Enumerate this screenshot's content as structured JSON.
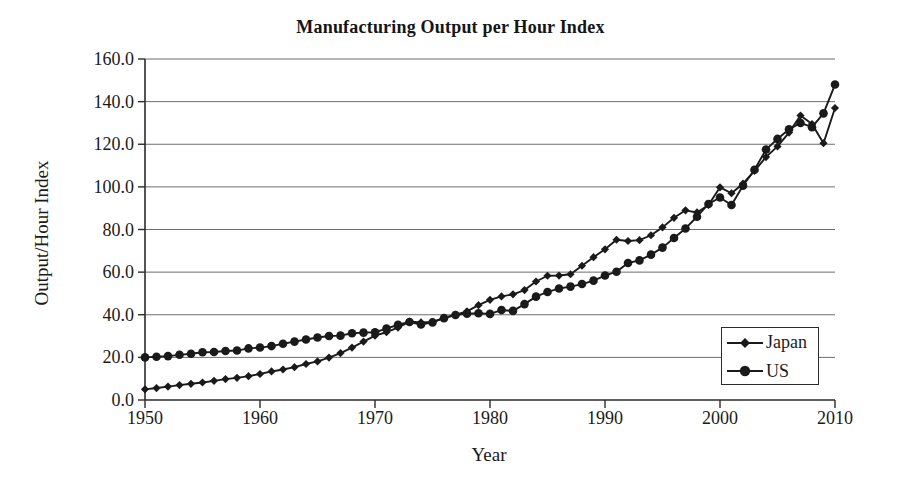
{
  "chart_data": {
    "type": "line",
    "title": "Manufacturing Output per Hour Index",
    "xlabel": "Year",
    "ylabel": "Output/Hour Index",
    "xlim": [
      1950,
      2010
    ],
    "ylim": [
      0,
      160
    ],
    "grid": "horizontal",
    "legend_position": "bottom-right",
    "xticks": [
      "1950",
      "1960",
      "1970",
      "1980",
      "1990",
      "2000",
      "2010"
    ],
    "yticks": [
      "0.0",
      "20.0",
      "40.0",
      "60.0",
      "80.0",
      "100.0",
      "120.0",
      "140.0",
      "160.0"
    ],
    "x": [
      1950,
      1951,
      1952,
      1953,
      1954,
      1955,
      1956,
      1957,
      1958,
      1959,
      1960,
      1961,
      1962,
      1963,
      1964,
      1965,
      1966,
      1967,
      1968,
      1969,
      1970,
      1971,
      1972,
      1973,
      1974,
      1975,
      1976,
      1977,
      1978,
      1979,
      1980,
      1981,
      1982,
      1983,
      1984,
      1985,
      1986,
      1987,
      1988,
      1989,
      1990,
      1991,
      1992,
      1993,
      1994,
      1995,
      1996,
      1997,
      1998,
      1999,
      2000,
      2001,
      2002,
      2003,
      2004,
      2005,
      2006,
      2007,
      2008,
      2009,
      2010
    ],
    "series": [
      {
        "name": "Japan",
        "marker": "diamond",
        "color": "#1a1a1a",
        "values": [
          5.0,
          5.6,
          6.3,
          7.0,
          7.6,
          8.2,
          9.0,
          9.8,
          10.4,
          11.2,
          12.2,
          13.4,
          14.3,
          15.4,
          16.9,
          18.1,
          19.9,
          22.0,
          24.6,
          27.4,
          30.2,
          31.8,
          34.0,
          36.8,
          36.4,
          36.6,
          38.5,
          40.0,
          41.6,
          44.5,
          47.0,
          48.6,
          49.6,
          51.6,
          55.6,
          58.3,
          58.4,
          59.0,
          63.0,
          67.0,
          70.7,
          75.2,
          74.6,
          75.0,
          77.3,
          81.0,
          85.5,
          89.0,
          88.0,
          91.5,
          99.8,
          97.0,
          101.5,
          107.5,
          114.0,
          119.0,
          125.5,
          133.5,
          129.5,
          120.5,
          137.0
        ]
      },
      {
        "name": "US",
        "marker": "circle",
        "color": "#1a1a1a",
        "values": [
          20.0,
          20.3,
          20.6,
          21.2,
          21.7,
          22.4,
          22.5,
          23.0,
          23.2,
          24.2,
          24.6,
          25.3,
          26.4,
          27.4,
          28.4,
          29.3,
          30.0,
          30.2,
          31.3,
          31.6,
          31.8,
          33.5,
          35.3,
          36.6,
          35.4,
          36.4,
          38.4,
          39.9,
          40.5,
          40.7,
          40.4,
          42.2,
          41.8,
          45.0,
          48.5,
          50.7,
          52.3,
          53.2,
          54.4,
          56.0,
          58.4,
          60.2,
          64.3,
          65.5,
          68.2,
          71.5,
          76.0,
          80.5,
          86.0,
          92.0,
          95.0,
          91.5,
          100.5,
          108.0,
          117.5,
          122.5,
          127.0,
          130.0,
          128.0,
          134.5,
          148.0
        ]
      }
    ]
  }
}
